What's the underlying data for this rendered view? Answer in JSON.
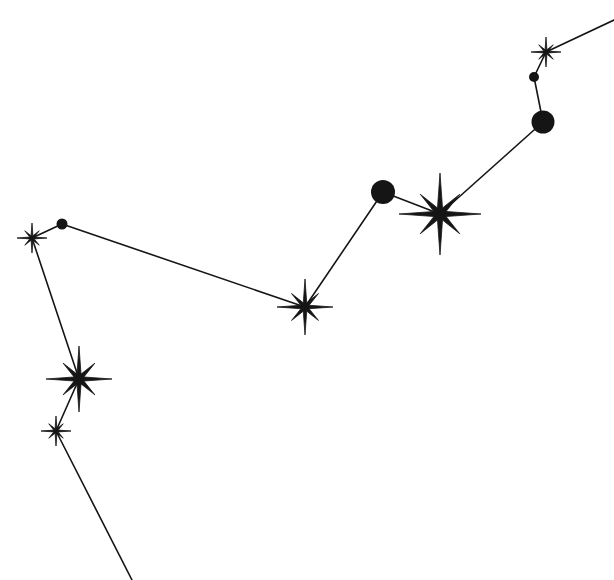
{
  "diagram": {
    "type": "constellation",
    "background": "#ffffff",
    "ink_color": "#151515",
    "line_width": 1.6,
    "stars": [
      {
        "id": "s1",
        "shape": "star8",
        "x": 546,
        "y": 52,
        "r": 15
      },
      {
        "id": "s2",
        "shape": "dot",
        "x": 534,
        "y": 77,
        "r": 5
      },
      {
        "id": "s3",
        "shape": "dot",
        "x": 543,
        "y": 122,
        "r": 11.5
      },
      {
        "id": "s4",
        "shape": "star8",
        "x": 440,
        "y": 214,
        "r": 41
      },
      {
        "id": "s5",
        "shape": "dot",
        "x": 383,
        "y": 192,
        "r": 12
      },
      {
        "id": "s6",
        "shape": "star8",
        "x": 305,
        "y": 307,
        "r": 28
      },
      {
        "id": "s7",
        "shape": "dot",
        "x": 62,
        "y": 224,
        "r": 5.5
      },
      {
        "id": "s8",
        "shape": "star8",
        "x": 32,
        "y": 238,
        "r": 15
      },
      {
        "id": "s9",
        "shape": "star8",
        "x": 79,
        "y": 379,
        "r": 33
      },
      {
        "id": "s10",
        "shape": "star8",
        "x": 56,
        "y": 431,
        "r": 15
      }
    ],
    "lines": [
      {
        "from": [
          614,
          20
        ],
        "to": [
          546,
          52
        ]
      },
      {
        "from": [
          546,
          52
        ],
        "to": [
          534,
          77
        ]
      },
      {
        "from": [
          534,
          77
        ],
        "to": [
          543,
          122
        ]
      },
      {
        "from": [
          543,
          122
        ],
        "to": [
          440,
          214
        ]
      },
      {
        "from": [
          440,
          214
        ],
        "to": [
          383,
          192
        ]
      },
      {
        "from": [
          383,
          192
        ],
        "to": [
          305,
          307
        ]
      },
      {
        "from": [
          305,
          307
        ],
        "to": [
          62,
          224
        ]
      },
      {
        "from": [
          62,
          224
        ],
        "to": [
          32,
          238
        ]
      },
      {
        "from": [
          32,
          238
        ],
        "to": [
          79,
          379
        ]
      },
      {
        "from": [
          79,
          379
        ],
        "to": [
          56,
          431
        ]
      },
      {
        "from": [
          56,
          431
        ],
        "to": [
          132,
          580
        ]
      }
    ]
  }
}
